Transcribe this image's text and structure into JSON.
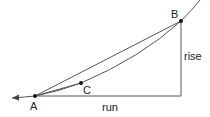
{
  "diagram": {
    "points": [
      {
        "id": "A",
        "label": "A",
        "x": 35,
        "y": 96
      },
      {
        "id": "B",
        "label": "B",
        "x": 181,
        "y": 21
      },
      {
        "id": "C",
        "label": "C",
        "x": 81,
        "y": 83
      }
    ],
    "labels": {
      "rise": "rise",
      "run": "run"
    },
    "colors": {
      "line": "#444444",
      "point": "#111111"
    }
  }
}
